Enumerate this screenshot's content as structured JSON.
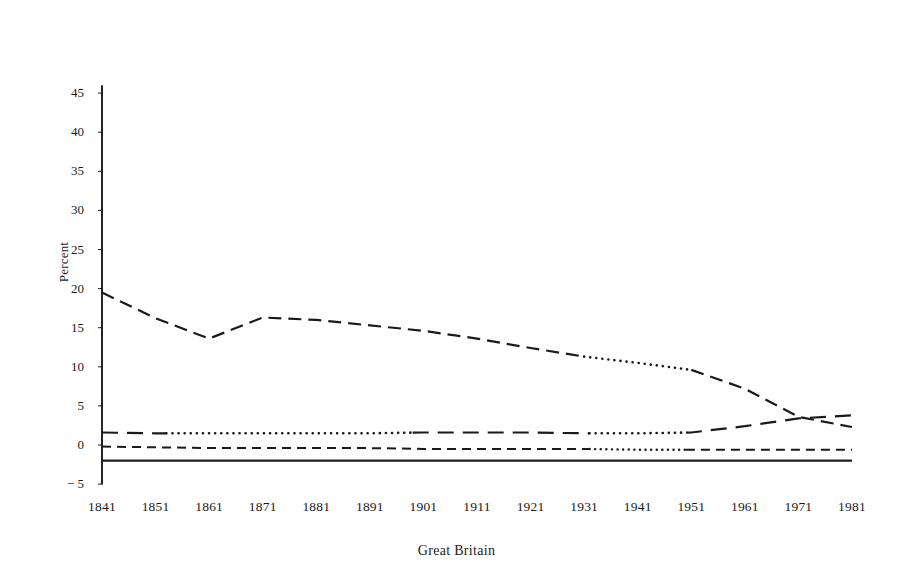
{
  "chart_data": {
    "type": "line",
    "title": "",
    "subtitle": "",
    "xlabel": "Great Britain",
    "ylabel": "Percent",
    "x": [
      1841,
      1851,
      1861,
      1871,
      1881,
      1891,
      1901,
      1911,
      1921,
      1931,
      1941,
      1951,
      1961,
      1971,
      1981
    ],
    "categories": [
      "1841",
      "1851",
      "1861",
      "1871",
      "1881",
      "1891",
      "1901",
      "1911",
      "1921",
      "1931",
      "1941",
      "1951",
      "1961",
      "1971",
      "1981"
    ],
    "xlim": [
      1841,
      1981
    ],
    "ylim": [
      -5,
      46
    ],
    "y_ticks": [
      45,
      40,
      35,
      30,
      25,
      20,
      15,
      10,
      5,
      0,
      -5
    ],
    "y_tick_labels": [
      "45",
      "40",
      "35",
      "30",
      "25",
      "20",
      "15",
      "10",
      "5",
      "0",
      "− 5"
    ],
    "grid": false,
    "legend": "none",
    "series": [
      {
        "name": "series-1-declining",
        "style": "dash-dot-to-dotted",
        "values": [
          19.5,
          16.2,
          13.6,
          16.3,
          16.0,
          15.3,
          14.6,
          13.6,
          12.4,
          11.3,
          10.5,
          9.6,
          7.2,
          3.6,
          2.3
        ]
      },
      {
        "name": "series-2-near-zero-rising",
        "style": "long-dash-to-dotted",
        "values": [
          1.6,
          1.5,
          1.5,
          1.5,
          1.5,
          1.5,
          1.6,
          1.6,
          1.6,
          1.5,
          1.5,
          1.6,
          2.4,
          3.4,
          3.8
        ]
      },
      {
        "name": "series-3-flat-negative",
        "style": "short-dash-to-dotted",
        "values": [
          -0.2,
          -0.3,
          -0.4,
          -0.4,
          -0.4,
          -0.4,
          -0.5,
          -0.5,
          -0.5,
          -0.5,
          -0.6,
          -0.6,
          -0.6,
          -0.6,
          -0.6
        ]
      },
      {
        "name": "series-4-baseline-solid",
        "style": "solid",
        "values": [
          -2.0,
          -2.0,
          -2.0,
          -2.0,
          -2.0,
          -2.0,
          -2.0,
          -2.0,
          -2.0,
          -2.0,
          -2.0,
          -2.0,
          -2.0,
          -2.0,
          -2.0
        ]
      }
    ],
    "axis_notes": {
      "y_axis_line": "vertical solid rule at x=1841 spanning 46 down to -5",
      "x_axis_line": "horizontal solid rule at y=-2 spanning 1841 to 1981"
    }
  },
  "colors": {
    "ink": "#1a1a1a",
    "background": "#ffffff"
  }
}
